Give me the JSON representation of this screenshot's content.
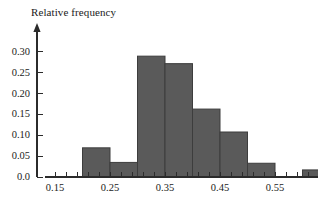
{
  "chart_data": {
    "type": "bar",
    "title": "",
    "xlabel": "",
    "ylabel": "Relative frequency",
    "bin_width": 0.05,
    "bin_edges": [
      0.2,
      0.25,
      0.3,
      0.35,
      0.4,
      0.45,
      0.5,
      0.55,
      0.6,
      0.65
    ],
    "categories": [
      "0.20-0.25",
      "0.25-0.30",
      "0.30-0.35",
      "0.35-0.40",
      "0.40-0.45",
      "0.45-0.50",
      "0.50-0.55",
      "0.60-0.65"
    ],
    "bars": [
      {
        "left": 0.2,
        "right": 0.25,
        "value": 0.07
      },
      {
        "left": 0.25,
        "right": 0.3,
        "value": 0.035
      },
      {
        "left": 0.3,
        "right": 0.35,
        "value": 0.29
      },
      {
        "left": 0.35,
        "right": 0.4,
        "value": 0.272
      },
      {
        "left": 0.4,
        "right": 0.45,
        "value": 0.163
      },
      {
        "left": 0.45,
        "right": 0.5,
        "value": 0.108
      },
      {
        "left": 0.5,
        "right": 0.55,
        "value": 0.033
      },
      {
        "left": 0.6,
        "right": 0.65,
        "value": 0.017
      }
    ],
    "values": [
      0.07,
      0.035,
      0.29,
      0.272,
      0.163,
      0.108,
      0.033,
      0.017
    ],
    "xlim": [
      0.13,
      0.69
    ],
    "ylim": [
      0.0,
      0.315
    ],
    "ytick_values": [
      0.0,
      0.05,
      0.1,
      0.15,
      0.2,
      0.25,
      0.3
    ],
    "ytick_labels": [
      "0.0",
      "0.05",
      "0.10",
      "0.15",
      "0.20",
      "0.25",
      "0.30"
    ],
    "xtick_labels": [
      "0.15",
      "0.25",
      "0.35",
      "0.45",
      "0.55",
      "0.65"
    ],
    "xtick_values": [
      0.15,
      0.25,
      0.35,
      0.45,
      0.55,
      0.65
    ],
    "x_minor_step": 0.02,
    "grid": false,
    "legend": null,
    "bar_fill_color": "#5a5a5a",
    "bar_edge_color": "#3d3d3d",
    "axis_color": "#2b2b2b",
    "background_color": "#ffffff",
    "y_axis_has_arrow": true
  }
}
